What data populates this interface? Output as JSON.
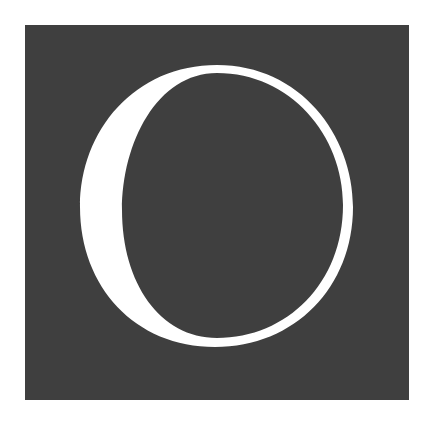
{
  "drop_cap": {
    "letter": "O",
    "background_color": "#3f3f3f",
    "letter_color": "#ffffff"
  }
}
